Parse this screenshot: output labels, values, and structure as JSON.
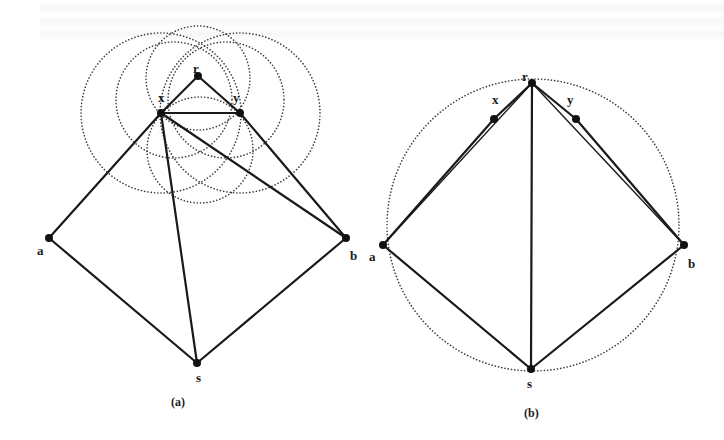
{
  "figure": {
    "panels": [
      {
        "id": "a",
        "caption": "(a)",
        "nodes": {
          "r": {
            "label": "r",
            "x": 198,
            "y": 76
          },
          "x": {
            "label": "x",
            "x": 161,
            "y": 113
          },
          "y": {
            "label": "y",
            "x": 240,
            "y": 113
          },
          "a": {
            "label": "a",
            "x": 49,
            "y": 238
          },
          "b": {
            "label": "b",
            "x": 346,
            "y": 238
          },
          "s": {
            "label": "s",
            "x": 197,
            "y": 363
          }
        },
        "edges": [
          [
            "r",
            "x"
          ],
          [
            "r",
            "y"
          ],
          [
            "x",
            "y"
          ],
          [
            "x",
            "a"
          ],
          [
            "x",
            "s"
          ],
          [
            "x",
            "b"
          ],
          [
            "y",
            "b"
          ],
          [
            "a",
            "s"
          ],
          [
            "s",
            "b"
          ]
        ],
        "dotted_circles": [
          {
            "cx": 161,
            "cy": 113,
            "r": 80
          },
          {
            "cx": 240,
            "cy": 113,
            "r": 80
          },
          {
            "cx": 198,
            "cy": 78,
            "r": 52
          },
          {
            "cx": 200,
            "cy": 150,
            "r": 53
          },
          {
            "cx": 174,
            "cy": 100,
            "r": 58
          },
          {
            "cx": 226,
            "cy": 100,
            "r": 58
          }
        ]
      },
      {
        "id": "b",
        "caption": "(b)",
        "nodes": {
          "r": {
            "label": "r",
            "x": 532,
            "y": 83
          },
          "x": {
            "label": "x",
            "x": 494,
            "y": 119
          },
          "y": {
            "label": "y",
            "x": 576,
            "y": 119
          },
          "a": {
            "label": "a",
            "x": 383,
            "y": 245
          },
          "b": {
            "label": "b",
            "x": 684,
            "y": 245
          },
          "s": {
            "label": "s",
            "x": 531,
            "y": 369
          }
        },
        "edges": [
          [
            "r",
            "x"
          ],
          [
            "r",
            "y"
          ],
          [
            "x",
            "a"
          ],
          [
            "y",
            "b"
          ],
          [
            "r",
            "a"
          ],
          [
            "r",
            "b"
          ],
          [
            "r",
            "s"
          ],
          [
            "a",
            "s"
          ],
          [
            "s",
            "b"
          ]
        ],
        "dotted_circles": [
          {
            "cx": 533,
            "cy": 225,
            "r": 146
          }
        ]
      }
    ]
  },
  "labels": {
    "a_r": "r",
    "a_x": "x",
    "a_y": "y",
    "a_a": "a",
    "a_b": "b",
    "a_s": "s",
    "a_caption": "(a)",
    "b_r": "r",
    "b_x": "x",
    "b_y": "y",
    "b_a": "a",
    "b_b": "b",
    "b_s": "s",
    "b_caption": "(b)"
  }
}
